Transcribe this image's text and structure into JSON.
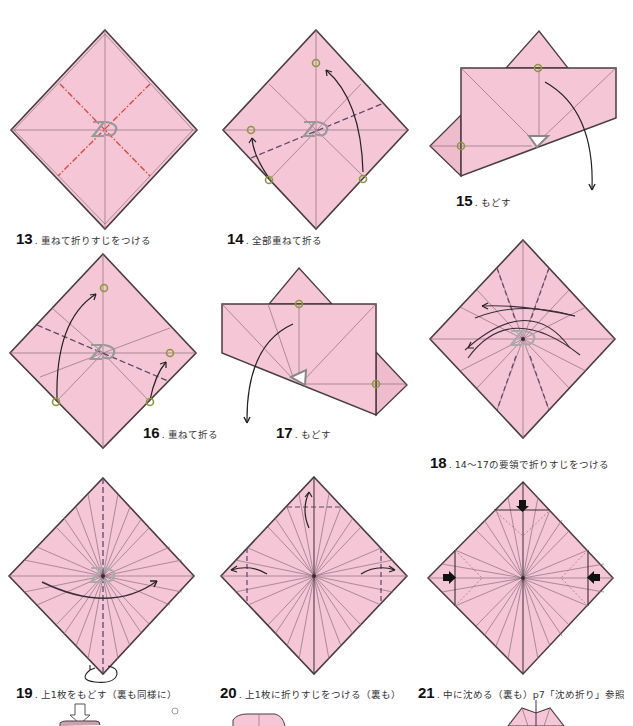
{
  "colors": {
    "paper": "#f4c6d6",
    "paper_shade": "#eebccd",
    "edge": "#4a3d42",
    "crease": "#8c6f7c",
    "mountain": "#d9453a",
    "valley": "#5a4a66",
    "marker": "#8a9a3a",
    "arrow": "#222222"
  },
  "steps": [
    {
      "num": "13",
      "text": "重ねて折りすじをつける"
    },
    {
      "num": "14",
      "text": "全部重ねて折る"
    },
    {
      "num": "15",
      "text": "もどす"
    },
    {
      "num": "16",
      "text": "重ねて折る"
    },
    {
      "num": "17",
      "text": "もどす"
    },
    {
      "num": "18",
      "text": "14〜17の要領で折りすじをつける"
    },
    {
      "num": "19",
      "text": "上1枚をもどす（裏も同様に）"
    },
    {
      "num": "20",
      "text": "上1枚に折りすじをつける（裏も）"
    },
    {
      "num": "21",
      "text": "中に沈める（裏も）p7「沈め折り」参照"
    }
  ],
  "symbols": {
    "layer_marker": "layered-paper-icon",
    "point_marker": "circle-target-icon",
    "push_arrow": "push-arrow-icon",
    "turn_over": "turn-over-icon"
  }
}
